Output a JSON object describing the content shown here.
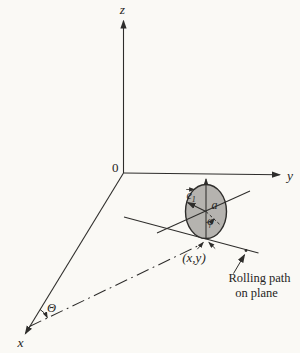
{
  "figure": {
    "type": "textbook-mechanics-diagram",
    "colors": {
      "background": "#faf9f5",
      "ink": "#2e2d2b",
      "disk_fill": "#b5b3af"
    },
    "labels": {
      "z_axis": "z",
      "y_axis": "y",
      "x_axis": "x",
      "origin": "0",
      "theta": "Θ",
      "phi": "φ",
      "disk_radius": "a",
      "e1_base": "e",
      "e1_sub": "1",
      "contact_point": "(x,y)",
      "rolling_path_line1": "Rolling path",
      "rolling_path_line2": "on plane"
    }
  }
}
